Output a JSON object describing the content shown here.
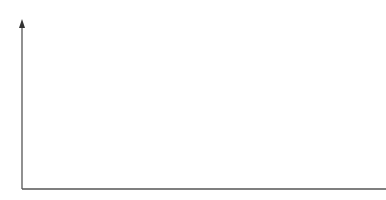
{
  "diagram": {
    "y_axis_label": "Results/potential capability",
    "x_axis_label": "Time → (label partially cut off)",
    "curve_color": "#1a1a1a",
    "axis_color": "#555555",
    "groups": [
      {
        "label": "RR",
        "from": "A",
        "to": "B"
      },
      {
        "label": "RR",
        "from": "B",
        "to": "D"
      },
      {
        "label": "RR",
        "from": "D",
        "to": "G"
      }
    ],
    "curves": [
      {
        "label": "A",
        "peak_x": 105
      },
      {
        "label": "B",
        "peak_x": 162
      },
      {
        "label": "C",
        "peak_x": 203
      },
      {
        "label": "D",
        "peak_x": 236
      },
      {
        "label": "E",
        "peak_x": 269
      },
      {
        "label": "F",
        "peak_x": 290
      },
      {
        "label": "G",
        "peak_x": 313
      }
    ]
  }
}
